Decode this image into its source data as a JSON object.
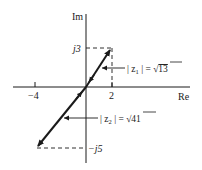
{
  "diagram": {
    "type": "complex-plane-vectors",
    "axes": {
      "real_label": "Re",
      "imag_label": "Im",
      "real_ticks": [
        {
          "value": -4,
          "label": "−4"
        },
        {
          "value": 2,
          "label": "2"
        }
      ],
      "imag_ticks": [
        {
          "value": 3,
          "label": "j3"
        },
        {
          "value": -5,
          "label": "−j5"
        }
      ]
    },
    "vectors": [
      {
        "name": "z1",
        "re": 2,
        "im": 3,
        "magnitude_label": "|z1| = √13",
        "lhs": "| z",
        "sub": "1",
        "rhs": " | = ",
        "sqrt_arg": "13"
      },
      {
        "name": "z2",
        "re": -4,
        "im": -5,
        "magnitude_label": "|z2| = √41",
        "lhs": "| z",
        "sub": "2",
        "rhs": " | = ",
        "sqrt_arg": "41"
      }
    ],
    "colors": {
      "ink": "#1a1a1a",
      "background": "#ffffff"
    }
  }
}
